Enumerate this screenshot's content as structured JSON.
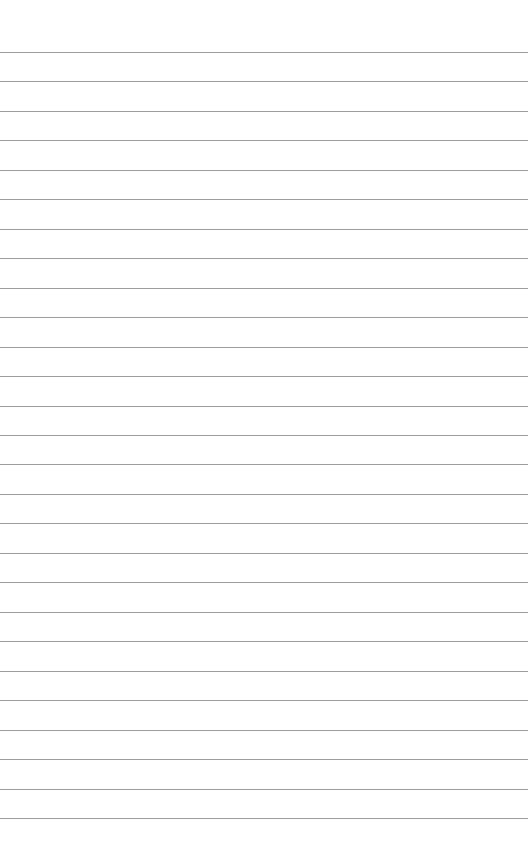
{
  "page": {
    "type": "lined-paper",
    "background_color": "#ffffff",
    "line_color": "#8c8c8c",
    "line_count": 27,
    "first_line_y": 52,
    "line_spacing": 29.46,
    "text": []
  }
}
